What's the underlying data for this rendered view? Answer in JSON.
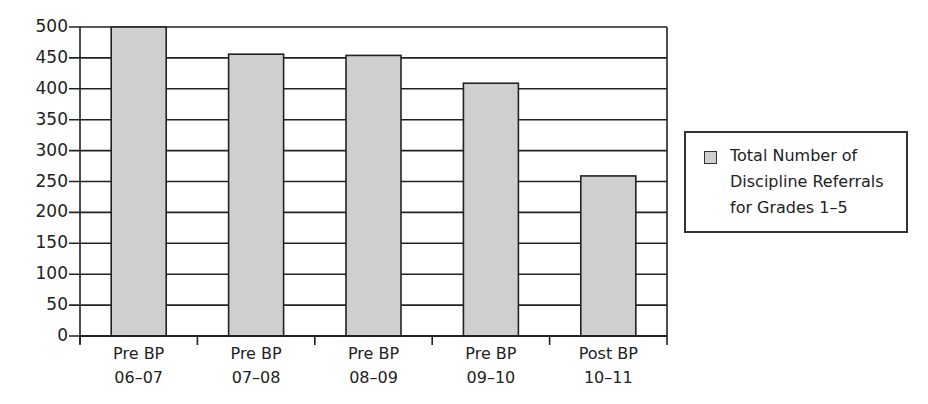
{
  "chart_data": {
    "type": "bar",
    "title": "",
    "xlabel": "",
    "ylabel": "",
    "categories": [
      "Pre BP 06-07",
      "Pre BP 07-08",
      "Pre BP 08-09",
      "Pre BP 09-10",
      "Post BP 10-11"
    ],
    "category_lines": [
      [
        "Pre BP",
        "06–07"
      ],
      [
        "Pre BP",
        "07–08"
      ],
      [
        "Pre BP",
        "08–09"
      ],
      [
        "Pre BP",
        "09–10"
      ],
      [
        "Post BP",
        "10–11"
      ]
    ],
    "series": [
      {
        "name": "Total Number of Discipline Referrals for Grades 1–5",
        "values": [
          500,
          456,
          454,
          409,
          259
        ],
        "color": "#cfcfcf"
      }
    ],
    "ylim": [
      0,
      500
    ],
    "yticks": [
      0,
      50,
      100,
      150,
      200,
      250,
      300,
      350,
      400,
      450,
      500
    ],
    "grid": true,
    "legend_position": "right"
  },
  "legend": {
    "lines": [
      "Total Number of",
      "Discipline Referrals",
      "for Grades 1–5"
    ]
  }
}
